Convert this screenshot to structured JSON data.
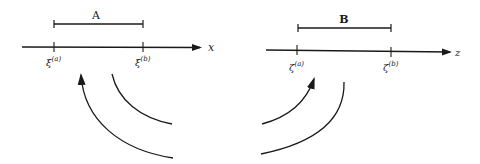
{
  "panels": [
    {
      "interval_label": "A",
      "axis_label": "x",
      "tick_a": {
        "base": "ξ",
        "sup": "(a)"
      },
      "tick_b": {
        "base": "ξ",
        "sup": "(b)"
      },
      "arrow_direction": "mapping from curve toward ξ(a)"
    },
    {
      "interval_label": "B",
      "axis_label": "z",
      "tick_a": {
        "base": "ζ",
        "sup": "(a)"
      },
      "tick_b": {
        "base": "ζ",
        "sup": "(b)"
      },
      "arrow_direction": "mapping from curve toward ζ(a)"
    }
  ],
  "colors": {
    "ink": "#1a1a1a",
    "background": "#ffffff"
  }
}
